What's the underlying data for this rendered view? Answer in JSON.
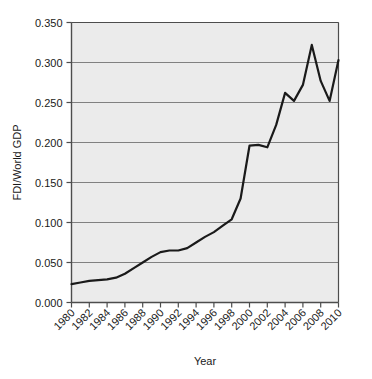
{
  "chart_data": {
    "type": "line",
    "title": "",
    "xlabel": "Year",
    "ylabel": "FDI/World GDP",
    "xlim": [
      1980,
      2010
    ],
    "ylim": [
      0.0,
      0.35
    ],
    "grid": true,
    "legend": false,
    "yticks": [
      "0.000",
      "0.050",
      "0.100",
      "0.150",
      "0.200",
      "0.250",
      "0.300",
      "0.350"
    ],
    "ytick_values": [
      0.0,
      0.05,
      0.1,
      0.15,
      0.2,
      0.25,
      0.3,
      0.35
    ],
    "xticks": [
      "1980",
      "1982",
      "1984",
      "1986",
      "1988",
      "1990",
      "1992",
      "1994",
      "1996",
      "1998",
      "2000",
      "2002",
      "2004",
      "2006",
      "2008",
      "2010"
    ],
    "xtick_values": [
      1980,
      1982,
      1984,
      1986,
      1988,
      1990,
      1992,
      1994,
      1996,
      1998,
      2000,
      2002,
      2004,
      2006,
      2008,
      2010
    ],
    "x": [
      1980,
      1981,
      1982,
      1983,
      1984,
      1985,
      1986,
      1987,
      1988,
      1989,
      1990,
      1991,
      1992,
      1993,
      1994,
      1995,
      1996,
      1997,
      1998,
      1999,
      2000,
      2001,
      2002,
      2003,
      2004,
      2005,
      2006,
      2007,
      2008,
      2009,
      2010
    ],
    "series": [
      {
        "name": "FDI/World GDP",
        "color": "#1a1a1a",
        "linewidth": 2.2,
        "values": [
          0.023,
          0.025,
          0.027,
          0.028,
          0.029,
          0.031,
          0.036,
          0.043,
          0.05,
          0.057,
          0.063,
          0.065,
          0.065,
          0.068,
          0.075,
          0.082,
          0.088,
          0.096,
          0.104,
          0.13,
          0.196,
          0.197,
          0.194,
          0.222,
          0.262,
          0.252,
          0.272,
          0.322,
          0.277,
          0.252,
          0.303
        ]
      }
    ],
    "plot_bgcolor": "#ebebeb",
    "gridline_color": "#808080",
    "axis_color": "#4d4d4d",
    "figure_bgcolor": "#ffffff"
  }
}
